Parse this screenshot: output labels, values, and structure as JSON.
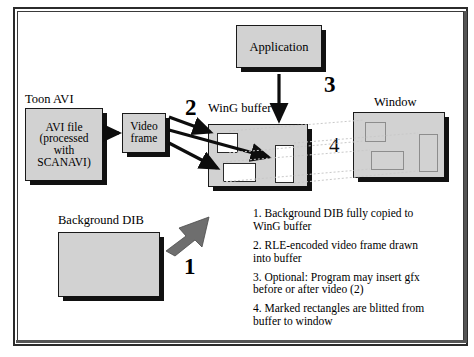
{
  "diagram": {
    "boxes": {
      "avi_file": {
        "label": "AVI file\n(processed\nwith\nSCANAVI)",
        "lines": [
          "AVI file",
          "(processed",
          "with",
          "SCANAVI)"
        ]
      },
      "video_frame": {
        "lines": [
          "Video",
          "frame"
        ]
      },
      "application": {
        "lines": [
          "Application"
        ]
      },
      "background_dib": {
        "lines": []
      },
      "wing_buffer": {
        "lines": []
      },
      "window": {
        "lines": []
      }
    },
    "labels": {
      "toon_avi": "Toon AVI",
      "wing_buffer": "WinG buffer",
      "window": "Window",
      "background_dib": "Background DIB"
    },
    "step_numbers": {
      "one": "1",
      "two": "2",
      "three": "3",
      "four": "4"
    },
    "captions": [
      "1. Background DIB fully copied to WinG buffer",
      "2. RLE-encoded video frame drawn into buffer",
      "3. Optional: Program may insert gfx before or after video (2)",
      "4. Marked rectangles are blitted from buffer to window"
    ],
    "colors": {
      "box_fill": "#d2d2d2",
      "box_border": "#1a1a1a",
      "shadow": "#111111",
      "arrow": "#0d0d0d",
      "block_arrow": "#6e6e6e",
      "dotted_line": "#c9c9c9",
      "page_background": "#ffffff"
    }
  }
}
